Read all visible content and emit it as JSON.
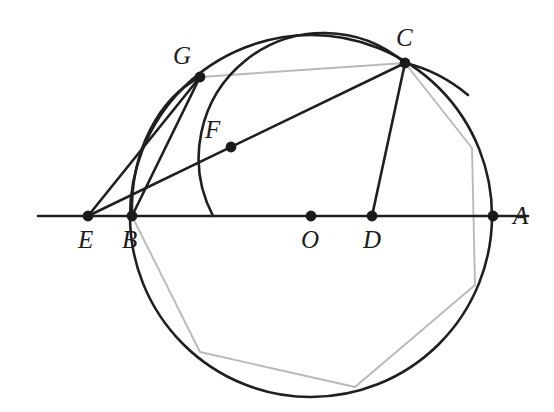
{
  "figure": {
    "canvas": {
      "width": 554,
      "height": 412,
      "background": "#ffffff"
    },
    "colors": {
      "ink": "#1f1f1f",
      "polygon": "#b9b9b9",
      "point": "#1a1a1a",
      "background": "#ffffff"
    },
    "stroke_widths": {
      "curve": 2.6,
      "line": 2.6,
      "axis": 2.6,
      "polygon": 1.8
    }
  },
  "labels": {
    "A": "A",
    "B": "B",
    "C": "C",
    "D": "D",
    "E": "E",
    "F": "F",
    "G": "G",
    "O": "O"
  },
  "points": {
    "A": {
      "name": "A",
      "x": 493,
      "y": 216,
      "label_x": 513,
      "label_y": 224
    },
    "B": {
      "name": "B",
      "x": 132,
      "y": 216,
      "label_x": 122,
      "label_y": 248
    },
    "C": {
      "name": "C",
      "x": 405,
      "y": 63,
      "label_x": 396,
      "label_y": 46
    },
    "D": {
      "name": "D",
      "x": 372,
      "y": 216,
      "label_x": 363,
      "label_y": 248
    },
    "E": {
      "name": "E",
      "x": 88,
      "y": 216,
      "label_x": 78,
      "label_y": 248
    },
    "F": {
      "name": "F",
      "x": 231,
      "y": 147,
      "label_x": 205,
      "label_y": 138
    },
    "G": {
      "name": "G",
      "x": 200,
      "y": 77,
      "label_x": 173,
      "label_y": 64
    },
    "O": {
      "name": "O",
      "x": 311,
      "y": 216,
      "label_x": 301,
      "label_y": 248
    }
  },
  "circle": {
    "name": "main-circle",
    "center_x": 311,
    "center_y": 216,
    "radius": 181
  },
  "arcs": {
    "arc_BFC": {
      "name": "arc-through-F-centered-at-E",
      "center_x": 88,
      "center_y": 216,
      "radius": 125,
      "start_x": 213,
      "start_y": 216,
      "end_x": 405,
      "end_y": 63
    },
    "arc_BG": {
      "name": "arc-from-B-through-G",
      "path": "M 132 216 C 130 150 160 98 200 77"
    },
    "arc_C_tangent": {
      "name": "arc-extension-beyond-C",
      "path": "M 405 63 C 427 68 450 80 468 95"
    }
  },
  "segments": [
    {
      "name": "axis-line",
      "x1": 38,
      "y1": 216,
      "x2": 528,
      "y2": 216
    },
    {
      "name": "segment-E-G",
      "x1": 88,
      "y1": 216,
      "x2": 200,
      "y2": 77
    },
    {
      "name": "segment-B-G",
      "x1": 132,
      "y1": 216,
      "x2": 200,
      "y2": 77
    },
    {
      "name": "segment-E-C",
      "x1": 88,
      "y1": 216,
      "x2": 405,
      "y2": 63
    },
    {
      "name": "segment-C-D",
      "x1": 405,
      "y1": 63,
      "x2": 372,
      "y2": 216
    }
  ],
  "polygon": {
    "name": "inscribed-heptagon",
    "stroke": "#b9b9b9",
    "vertices": [
      {
        "x": 132,
        "y": 216
      },
      {
        "x": 200,
        "y": 77
      },
      {
        "x": 405,
        "y": 63
      },
      {
        "x": 472,
        "y": 148
      },
      {
        "x": 475,
        "y": 285
      },
      {
        "x": 355,
        "y": 387
      },
      {
        "x": 200,
        "y": 352
      }
    ]
  }
}
